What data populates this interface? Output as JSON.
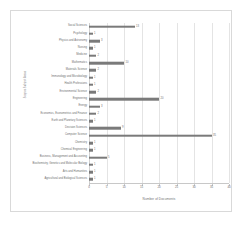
{
  "chart_data": {
    "type": "bar",
    "orientation": "horizontal",
    "title": "",
    "xlabel": "Number of Documents",
    "ylabel": "Scopus Subject Areas",
    "xlim": [
      0,
      40
    ],
    "xticks": [
      0,
      5,
      10,
      15,
      20,
      25,
      30,
      35,
      40
    ],
    "grid": true,
    "legend": false,
    "bar_color": "#7a7a7a",
    "grid_color": "#e4e4e4",
    "text_color": "#6f6f6f",
    "categories": [
      "Social Sciences",
      "Psychology",
      "Physics and Astronomy",
      "Nursing",
      "Medicine",
      "Mathematics",
      "Materials Science",
      "Immunology and Microbiology",
      "Health Professions",
      "Environmental Science",
      "Engineering",
      "Energy",
      "Economics, Econometrics and Finance",
      "Earth and Planetary Sciences",
      "Decision Sciences",
      "Computer Science",
      "Chemistry",
      "Chemical Engineering",
      "Business, Management and Accounting",
      "Biochemistry, Genetics and Molecular Biology",
      "Arts and Humanities",
      "Agricultural and Biological Sciences"
    ],
    "values": [
      13,
      1,
      3,
      1,
      2,
      10,
      2,
      1,
      1,
      2,
      20,
      3,
      2,
      1,
      9,
      35,
      1,
      1,
      5,
      1,
      1,
      1
    ],
    "value_labels": [
      "13",
      "1",
      "3",
      "1",
      "2",
      "10",
      "2",
      "1",
      "1",
      "2",
      "20",
      "3",
      "2",
      "1",
      "9",
      "35",
      "1",
      "1",
      "5",
      "1",
      "1",
      "1"
    ]
  }
}
